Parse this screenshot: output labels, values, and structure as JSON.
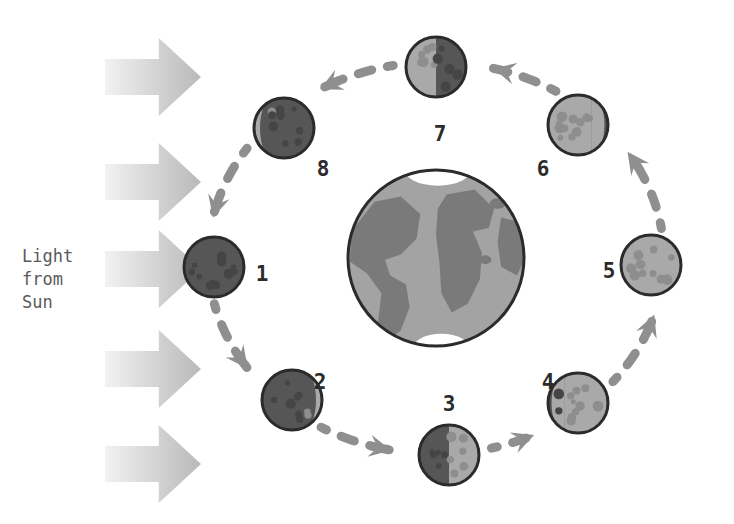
{
  "canvas": {
    "width": 734,
    "height": 524,
    "background": "#ffffff"
  },
  "sunlight": {
    "label_lines": [
      "Light",
      "from",
      "Sun"
    ],
    "label_color": "#5a5a5a",
    "label_x": 22,
    "label_y": 245,
    "label_line_height": 23,
    "label_font_size": 17,
    "arrow_count": 5,
    "arrow_color_light": "#f2f2f2",
    "arrow_color_dark": "#b9b9b9",
    "arrow_direction": "right",
    "arrows": [
      {
        "name": "sun-ray-1",
        "x": 105,
        "y": 38,
        "w": 96,
        "h": 78
      },
      {
        "name": "sun-ray-2",
        "x": 105,
        "y": 143,
        "w": 96,
        "h": 78
      },
      {
        "name": "sun-ray-3",
        "x": 105,
        "y": 230,
        "w": 96,
        "h": 78
      },
      {
        "name": "sun-ray-4",
        "x": 105,
        "y": 330,
        "w": 96,
        "h": 78
      },
      {
        "name": "sun-ray-5",
        "x": 105,
        "y": 425,
        "w": 96,
        "h": 78
      }
    ]
  },
  "earth": {
    "name": "Earth",
    "cx": 436,
    "cy": 258,
    "r": 88,
    "ocean_color": "#a3a3a3",
    "land_color": "#7a7a7a",
    "ice_color": "#ffffff",
    "outline_color": "#2b2b2b",
    "outline_width": 3
  },
  "orbit": {
    "cx": 436,
    "cy": 258,
    "rx": 228,
    "ry": 196,
    "dash_color": "#8f8f8f",
    "dash_width": 9,
    "direction": "counterclockwise",
    "sequence": [
      1,
      2,
      3,
      4,
      5,
      6,
      7,
      8
    ]
  },
  "moon": {
    "radius": 30,
    "dark_color": "#565656",
    "lit_color": "#a9a9a9",
    "outline_color": "#2b2b2b",
    "outline_width": 3,
    "crater_dark_on_light": "#8e8e8e",
    "crater_light_on_dark": "#454545",
    "label_color": "#2b2b2b",
    "label_font_size": 21
  },
  "moons": [
    {
      "id": 1,
      "label": "1",
      "phase": "new-moon",
      "description": "New Moon - fully dark",
      "cx": 214,
      "cy": 267,
      "lit_fraction": 0.0,
      "lit_side": "none",
      "label_x": 262,
      "label_y": 275
    },
    {
      "id": 2,
      "label": "2",
      "phase": "waxing-crescent",
      "description": "Waxing Crescent - thin lit sliver on right",
      "cx": 292,
      "cy": 400,
      "lit_fraction": 0.3,
      "lit_side": "right",
      "label_x": 320,
      "label_y": 383
    },
    {
      "id": 3,
      "label": "3",
      "phase": "first-quarter",
      "description": "First Quarter - right half lit",
      "cx": 449,
      "cy": 455,
      "lit_fraction": 0.5,
      "lit_side": "right",
      "label_x": 449,
      "label_y": 405
    },
    {
      "id": 4,
      "label": "4",
      "phase": "waxing-gibbous",
      "description": "Waxing Gibbous - mostly lit on right",
      "cx": 578,
      "cy": 403,
      "lit_fraction": 0.72,
      "lit_side": "right",
      "label_x": 548,
      "label_y": 383
    },
    {
      "id": 5,
      "label": "5",
      "phase": "full-moon",
      "description": "Full Moon - fully lit",
      "cx": 651,
      "cy": 265,
      "lit_fraction": 1.0,
      "lit_side": "all",
      "label_x": 609,
      "label_y": 272
    },
    {
      "id": 6,
      "label": "6",
      "phase": "waning-gibbous",
      "description": "Waning Gibbous - mostly lit on left",
      "cx": 578,
      "cy": 125,
      "lit_fraction": 0.72,
      "lit_side": "left",
      "label_x": 543,
      "label_y": 170
    },
    {
      "id": 7,
      "label": "7",
      "phase": "last-quarter",
      "description": "Last Quarter - left half lit",
      "cx": 436,
      "cy": 67,
      "lit_fraction": 0.5,
      "lit_side": "left",
      "label_x": 440,
      "label_y": 135
    },
    {
      "id": 8,
      "label": "8",
      "phase": "waning-crescent",
      "description": "Waning Crescent - thin lit sliver on left",
      "cx": 284,
      "cy": 128,
      "lit_fraction": 0.3,
      "lit_side": "left",
      "label_x": 323,
      "label_y": 170
    }
  ],
  "orbit_arrows": [
    {
      "name": "orbit-arrow-8-to-1",
      "from": 8,
      "to": 1
    },
    {
      "name": "orbit-arrow-1-to-2",
      "from": 1,
      "to": 2
    },
    {
      "name": "orbit-arrow-2-to-3",
      "from": 2,
      "to": 3
    },
    {
      "name": "orbit-arrow-3-to-4",
      "from": 3,
      "to": 4
    },
    {
      "name": "orbit-arrow-4-to-5",
      "from": 4,
      "to": 5
    },
    {
      "name": "orbit-arrow-5-to-6",
      "from": 5,
      "to": 6
    },
    {
      "name": "orbit-arrow-6-to-7",
      "from": 6,
      "to": 7
    },
    {
      "name": "orbit-arrow-7-to-8",
      "from": 7,
      "to": 8
    }
  ]
}
